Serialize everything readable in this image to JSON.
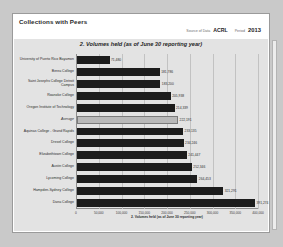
{
  "panel": {
    "title": "Collections with Peers"
  },
  "meta": {
    "source_label": "Source of Data",
    "source_value": "ACRL",
    "period_label": "Period",
    "period_value": "2013"
  },
  "chart_data": {
    "type": "bar",
    "orientation": "horizontal",
    "title": "2. Volumes held (as of June 30 reporting year)",
    "xlabel": "2. Volumes held (as of June 30 reporting year)",
    "ylabel": "",
    "xlim": [
      0,
      400000
    ],
    "grid": true,
    "legend": false,
    "xticks": [
      "0",
      "50,000",
      "100,000",
      "150,000",
      "200,000",
      "250,000",
      "300,000",
      "350,000",
      "400,000"
    ],
    "xtick_values": [
      0,
      50000,
      100000,
      150000,
      200000,
      250000,
      300000,
      350000,
      400000
    ],
    "categories": [
      "University of Puerto Rico Bayamon",
      "Berea College",
      "Saint Josephs College Detroit Campus",
      "Roanoke College",
      "Oregon Institute of Technology",
      "Average",
      "Aquinas College - Grand Rapids",
      "Drexel College",
      "Elizabethtown College",
      "Austin College",
      "Lycoming College",
      "Hampden-Sydney College",
      "Dana College"
    ],
    "values": [
      71480,
      181786,
      183200,
      205938,
      214339,
      222191,
      233135,
      234246,
      241447,
      252346,
      264453,
      321291,
      391274
    ],
    "value_labels": [
      "71,480",
      "181,786",
      "183,200",
      "205,938",
      "214,339",
      "222,191",
      "233,135",
      "234,246",
      "241,447",
      "252,346",
      "264,453",
      "321,291",
      "391,274"
    ],
    "highlight_category": "Average",
    "highlight_color": "#b9b9b9",
    "bar_color": "#1c1c1c"
  }
}
